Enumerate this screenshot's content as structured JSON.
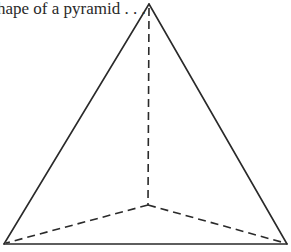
{
  "caption": "hape of a pyramid . . .",
  "diagram": {
    "type": "pyramid-tetrahedron",
    "stroke_color": "#2a2a2a",
    "vertices": {
      "apex": [
        149,
        4
      ],
      "base_left": [
        4,
        244
      ],
      "base_right": [
        287,
        244
      ],
      "hidden_center": [
        148,
        205
      ]
    },
    "solid_edges": [
      [
        "apex",
        "base_left"
      ],
      [
        "apex",
        "base_right"
      ],
      [
        "base_left",
        "base_right"
      ]
    ],
    "dashed_edges": [
      [
        "apex",
        "hidden_center"
      ],
      [
        "hidden_center",
        "base_left"
      ],
      [
        "hidden_center",
        "base_right"
      ]
    ]
  }
}
